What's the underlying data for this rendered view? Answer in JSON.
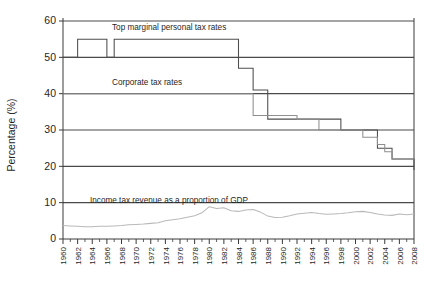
{
  "chart_data": {
    "type": "line",
    "title": "",
    "xlabel": "",
    "ylabel": "Percentage (%)",
    "ylim": [
      0,
      60
    ],
    "xlim": [
      1960,
      2008
    ],
    "grid": "horizontal",
    "legend_position": "inline-annotations",
    "yticks": [
      0,
      10,
      20,
      30,
      40,
      50,
      60
    ],
    "x": [
      1960,
      1961,
      1962,
      1963,
      1964,
      1965,
      1966,
      1967,
      1968,
      1969,
      1970,
      1971,
      1972,
      1973,
      1974,
      1975,
      1976,
      1977,
      1978,
      1979,
      1980,
      1981,
      1982,
      1983,
      1984,
      1985,
      1986,
      1987,
      1988,
      1989,
      1990,
      1991,
      1992,
      1993,
      1994,
      1995,
      1996,
      1997,
      1998,
      1999,
      2000,
      2001,
      2002,
      2003,
      2004,
      2005,
      2006,
      2007,
      2008
    ],
    "xtick_labels": [
      "1960",
      "1962",
      "1964",
      "1966",
      "1968",
      "1970",
      "1972",
      "1974",
      "1976",
      "1978",
      "1980",
      "1982",
      "1984",
      "1986",
      "1988",
      "1990",
      "1992",
      "1994",
      "1996",
      "1998",
      "2000",
      "2002",
      "2004",
      "2006",
      "2008"
    ],
    "annotations": [
      {
        "id": "personal-annotation",
        "text": "Top marginal personal tax rates"
      },
      {
        "id": "corporate-annotation",
        "text": "Corporate tax rates"
      },
      {
        "id": "revenue-annotation",
        "text": "Income tax revenue as a proportion of GDP"
      }
    ],
    "series": [
      {
        "name": "Top marginal personal tax rates",
        "color": "#4d4d4d",
        "values": [
          50,
          50,
          55,
          55,
          55,
          55,
          50,
          55,
          55,
          55,
          55,
          55,
          55,
          55,
          55,
          55,
          55,
          55,
          55,
          55,
          55,
          55,
          55,
          55,
          47,
          47,
          41,
          41,
          33,
          33,
          33,
          33,
          33,
          33,
          33,
          33,
          33,
          33,
          30,
          30,
          30,
          30,
          30,
          25,
          25,
          22,
          22,
          22,
          19
        ]
      },
      {
        "name": "Corporate tax rates",
        "color": "#8f8f8f",
        "values": [
          40,
          40,
          40,
          40,
          40,
          40,
          40,
          40,
          40,
          40,
          40,
          40,
          40,
          40,
          40,
          40,
          40,
          40,
          40,
          40,
          40,
          40,
          40,
          40,
          40,
          40,
          34,
          34,
          34,
          34,
          34,
          34,
          33,
          33,
          33,
          30,
          30,
          30,
          30,
          30,
          30,
          28,
          28,
          26,
          24,
          22,
          22,
          22,
          22
        ]
      },
      {
        "name": "Income tax revenue as a proportion of GDP",
        "color": "#b9b9b9",
        "values": [
          3.7,
          3.6,
          3.5,
          3.4,
          3.4,
          3.5,
          3.5,
          3.6,
          3.7,
          3.9,
          4.0,
          4.1,
          4.3,
          4.5,
          5.0,
          5.3,
          5.6,
          6.0,
          6.4,
          7.2,
          8.9,
          8.4,
          8.6,
          7.8,
          7.6,
          8.0,
          8.1,
          7.4,
          6.3,
          5.9,
          6.0,
          6.4,
          6.9,
          7.1,
          7.3,
          7.0,
          6.8,
          6.9,
          7.0,
          7.2,
          7.5,
          7.6,
          7.3,
          6.9,
          6.6,
          6.5,
          6.9,
          6.7,
          6.9
        ]
      }
    ]
  }
}
